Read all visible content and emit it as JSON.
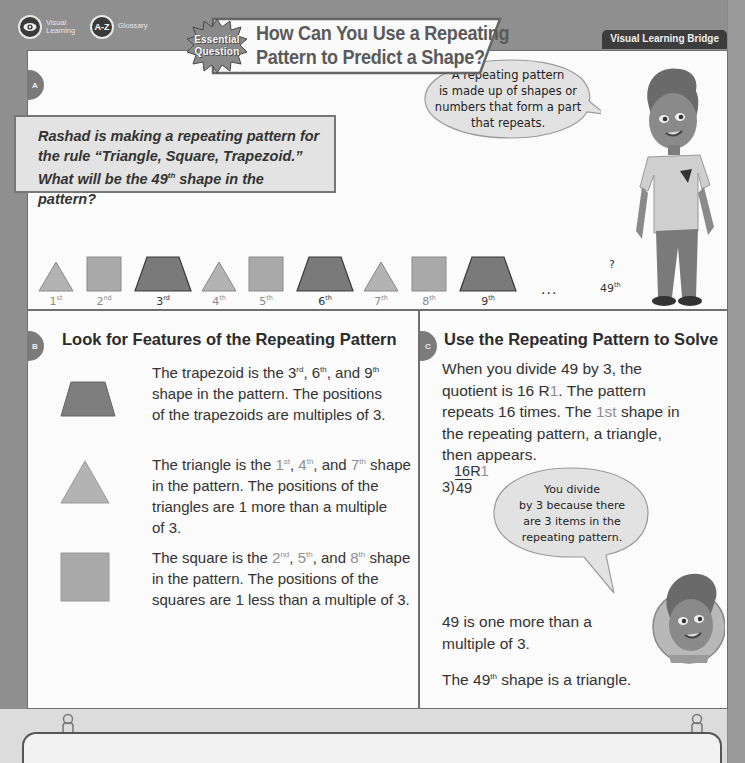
{
  "nav": {
    "visual_learning": {
      "icon": "eye-icon",
      "label_line1": "Visual",
      "label_line2": "Learning"
    },
    "glossary": {
      "icon_text": "A-Z",
      "label": "Glossary"
    }
  },
  "header": {
    "badge_line1": "Essential",
    "badge_line2": "Question",
    "title_line1": "How Can You Use a Repeating",
    "title_line2": "Pattern to Predict a Shape?",
    "section_label": "Visual Learning Bridge"
  },
  "colors": {
    "background": "#8f8f8f",
    "panel": "#fbfbfb",
    "triangle": "#b3b3b3",
    "square": "#a9a9a9",
    "trapezoid": "#7a7a7a",
    "badge_bg": "#3d3d3d"
  },
  "section_a": {
    "tab": "A",
    "problem_line1": "Rashad is making a repeating pattern for",
    "problem_line2": "the rule “Triangle, Square, Trapezoid.”",
    "problem_line3_pre": "What will be the 49",
    "problem_line3_sup": "th",
    "problem_line3_post": " shape in the pattern?",
    "bubble_line1": "A repeating pattern",
    "bubble_line2": "is made up of shapes or",
    "bubble_line3": "numbers that form a part",
    "bubble_line4": "that repeats.",
    "shapes": [
      {
        "shape": "triangle",
        "num": "1",
        "sup": "st"
      },
      {
        "shape": "square",
        "num": "2",
        "sup": "nd"
      },
      {
        "shape": "trapezoid",
        "num": "3",
        "sup": "rd"
      },
      {
        "shape": "triangle",
        "num": "4",
        "sup": "th"
      },
      {
        "shape": "square",
        "num": "5",
        "sup": "th"
      },
      {
        "shape": "trapezoid",
        "num": "6",
        "sup": "th"
      },
      {
        "shape": "triangle",
        "num": "7",
        "sup": "th"
      },
      {
        "shape": "square",
        "num": "8",
        "sup": "th"
      },
      {
        "shape": "trapezoid",
        "num": "9",
        "sup": "th"
      }
    ],
    "ellipsis": "...",
    "unknown_mark": "?",
    "target_num": "49",
    "target_sup": "th"
  },
  "section_b": {
    "tab": "B",
    "heading": "Look for Features of the Repeating Pattern",
    "trapezoid": {
      "l1_pre": "The trapezoid is the 3",
      "l1_s1": "rd",
      "l1_m1": ", 6",
      "l1_s2": "th",
      "l1_m2": ", and 9",
      "l1_s3": "th",
      "l2": "shape in the pattern. The positions",
      "l3": "of the trapezoids are multiples of 3."
    },
    "triangle": {
      "l1_pre": "The triangle is the ",
      "n1": "1",
      "s1": "st",
      "sep1": ", ",
      "n2": "4",
      "s2": "th",
      "sep2": ", and ",
      "n3": "7",
      "s3": "th",
      "l1_post": " shape",
      "l2": "in the pattern. The positions of the",
      "l3": "triangles are 1 more than a multiple",
      "l4": "of 3."
    },
    "square": {
      "l1_pre": "The square is the ",
      "n1": "2",
      "s1": "nd",
      "sep1": ", ",
      "n2": "5",
      "s2": "th",
      "sep2": ", and ",
      "n3": "8",
      "s3": "th",
      "l1_post": " shape",
      "l2": "in the pattern. The positions of the",
      "l3": "squares are 1 less than a multiple of 3."
    }
  },
  "section_c": {
    "tab": "C",
    "heading": "Use the Repeating Pattern to Solve",
    "p1_l1": "When you divide 49 by 3, the",
    "p1_l2_pre": "quotient is 16 R",
    "p1_l2_hl": "1",
    "p1_l2_post": ". The pattern",
    "p1_l3_pre": "repeats 16 times. The ",
    "p1_l3_hl": "1st",
    "p1_l3_post": " shape in",
    "p1_l4": "the repeating pattern, a triangle,",
    "p1_l5": "then appears.",
    "division": {
      "quotient": "16R",
      "remainder": "1",
      "divisor": "3",
      "dividend": "49"
    },
    "bubble_line1": "You divide",
    "bubble_line2": "by 3 because there",
    "bubble_line3": "are 3 items in the",
    "bubble_line4": "repeating pattern.",
    "p2_l1": "49 is one more than a",
    "p2_l2": "multiple of 3.",
    "p3_pre": "The 49",
    "p3_sup": "th",
    "p3_post": " shape is a triangle."
  }
}
